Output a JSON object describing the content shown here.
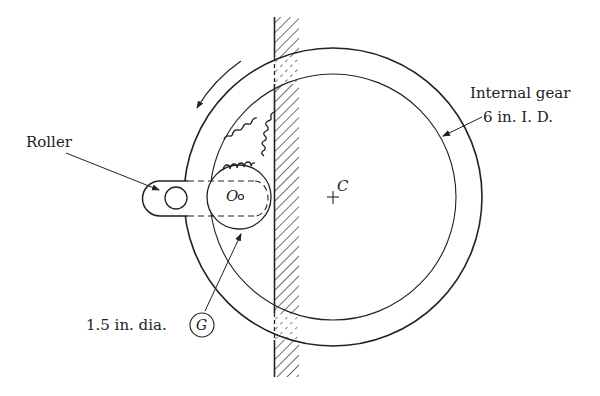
{
  "diagram": {
    "labels": {
      "roller": "Roller",
      "internal_gear_line1": "Internal gear",
      "internal_gear_line2": "6 in. I. D.",
      "gear_dia": "1.5 in. dia.",
      "gear_symbol": "G",
      "gear_center": "O",
      "ring_center": "C"
    },
    "colors": {
      "stroke": "#222222",
      "background": "#ffffff"
    },
    "rotation_direction": "counterclockwise"
  }
}
